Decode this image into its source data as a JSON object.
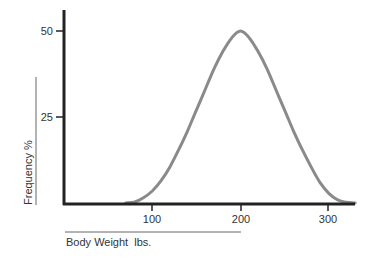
{
  "chart_data": {
    "type": "line",
    "title": "",
    "xlabel": "Body Weight  lbs.",
    "ylabel": "Frequency  %",
    "xlim": [
      0,
      330
    ],
    "ylim": [
      0,
      55
    ],
    "x_ticks": [
      100,
      200,
      300
    ],
    "y_ticks": [
      25,
      50
    ],
    "grid": false,
    "legend": null,
    "series": [
      {
        "name": "Body weight distribution",
        "color": "#8a8a8a",
        "x": [
          70,
          80,
          90,
          100,
          110,
          120,
          130,
          140,
          150,
          160,
          170,
          180,
          190,
          200,
          210,
          220,
          230,
          240,
          250,
          260,
          270,
          280,
          290,
          300,
          310,
          320,
          330
        ],
        "y": [
          0,
          0.3,
          1.5,
          3.5,
          6.5,
          10.5,
          15.5,
          21,
          27,
          33,
          39,
          44,
          48,
          50,
          48,
          44,
          39,
          33,
          27,
          21,
          15.5,
          10.5,
          6,
          2.8,
          0.9,
          0.2,
          0
        ]
      }
    ]
  },
  "labels": {
    "y_tick_50": "50",
    "y_tick_25": "25",
    "x_tick_100": "100",
    "x_tick_200": "200",
    "x_tick_300": "300",
    "x_axis_title": "Body Weight  lbs.",
    "y_axis_title": "Frequency   %"
  },
  "colors": {
    "axis": "#222222",
    "curve": "#8a8a8a",
    "text": "#333333"
  }
}
